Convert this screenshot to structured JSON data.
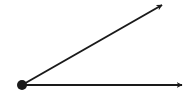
{
  "diagram": {
    "type": "angle",
    "colors": {
      "stroke": "#1a1a1a",
      "background": "#ffffff"
    },
    "vertex": {
      "x": 22,
      "y": 85,
      "r": 5
    },
    "rays": [
      {
        "name": "upper-ray",
        "x1": 22,
        "y1": 85,
        "x2": 162,
        "y2": 5
      },
      {
        "name": "lower-ray",
        "x1": 22,
        "y1": 85,
        "x2": 182,
        "y2": 85
      }
    ]
  }
}
